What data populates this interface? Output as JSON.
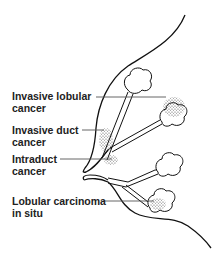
{
  "figure": {
    "colors": {
      "stroke": "#111111",
      "leader": "#555555",
      "stipple": "#444444",
      "background": "#ffffff"
    },
    "labels": [
      {
        "line1": "Invasive lobular",
        "line2": "cancer",
        "top": 90,
        "leader": {
          "x1": 96,
          "x2": 166,
          "y": 97
        }
      },
      {
        "line1": "Invasive duct",
        "line2": "cancer",
        "top": 124,
        "leader": {
          "x1": 82,
          "x2": 104,
          "y": 130
        }
      },
      {
        "line1": "Intraduct",
        "line2": "cancer",
        "top": 153,
        "leader": {
          "x1": 60,
          "x2": 112,
          "y": 159
        }
      },
      {
        "line1": "Lobular carcinoma",
        "line2": "in situ",
        "top": 195,
        "leader": {
          "x1": 103,
          "x2": 154,
          "y": 201
        }
      }
    ]
  }
}
